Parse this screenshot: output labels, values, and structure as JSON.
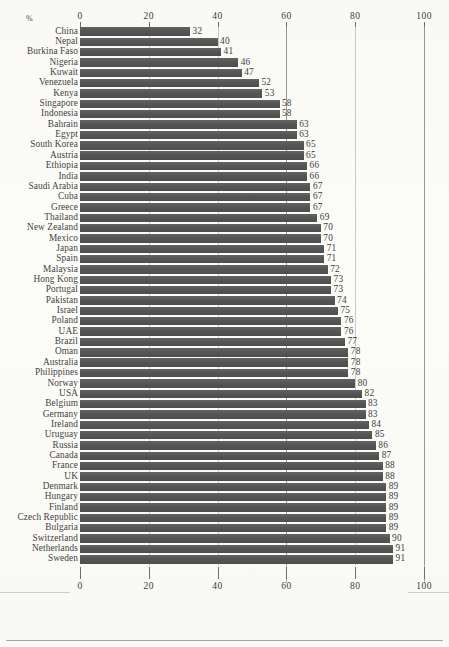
{
  "chart_data": {
    "type": "bar",
    "orientation": "horizontal",
    "title": "",
    "subtitle": "",
    "xlabel": "%",
    "ylabel": "",
    "xlim": [
      0,
      100
    ],
    "ticks": [
      0,
      20,
      40,
      60,
      80,
      100
    ],
    "tick_labels": [
      "0",
      "20",
      "40",
      "60",
      "80",
      "100"
    ],
    "grid": true,
    "legend": null,
    "axis_positions": [
      "top",
      "bottom"
    ],
    "bar_color": "#585858",
    "value_labels_shown": true,
    "categories": [
      "China",
      "Nepal",
      "Burkina Faso",
      "Nigeria",
      "Kuwait",
      "Venezuela",
      "Kenya",
      "Singapore",
      "Indonesia",
      "Bahrain",
      "Egypt",
      "South Korea",
      "Austria",
      "Ethiopia",
      "India",
      "Saudi Arabia",
      "Cuba",
      "Greece",
      "Thailand",
      "New Zealand",
      "Mexico",
      "Japan",
      "Spain",
      "Malaysia",
      "Hong Kong",
      "Portugal",
      "Pakistan",
      "Israel",
      "Poland",
      "UAE",
      "Brazil",
      "Oman",
      "Australia",
      "Philippines",
      "Norway",
      "USA",
      "Belgium",
      "Germany",
      "Ireland",
      "Uruguay",
      "Russia",
      "Canada",
      "France",
      "UK",
      "Denmark",
      "Hungary",
      "Finland",
      "Czech Republic",
      "Bulgaria",
      "Switzerland",
      "Netherlands",
      "Sweden"
    ],
    "values": [
      32,
      40,
      41,
      46,
      47,
      52,
      53,
      58,
      58,
      63,
      63,
      65,
      65,
      66,
      66,
      67,
      67,
      67,
      69,
      70,
      70,
      71,
      71,
      72,
      73,
      73,
      74,
      75,
      76,
      76,
      77,
      78,
      78,
      78,
      80,
      82,
      83,
      83,
      84,
      85,
      86,
      87,
      88,
      88,
      89,
      89,
      89,
      89,
      89,
      90,
      91,
      91
    ]
  },
  "axis": {
    "unit_symbol": "%"
  }
}
